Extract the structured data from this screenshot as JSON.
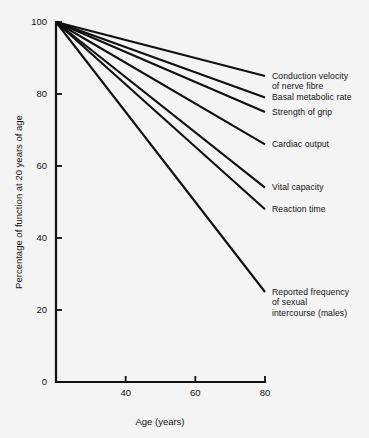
{
  "chart_data": {
    "type": "line",
    "title": "",
    "subtitle": "",
    "xlabel": "Age (years)",
    "ylabel": "Percentage of function at 20 years of age",
    "xlim": [
      20,
      80
    ],
    "ylim": [
      0,
      100
    ],
    "xticks": [
      40,
      60,
      80
    ],
    "xticklabels": [
      "40",
      "60",
      "80"
    ],
    "yticks": [
      0,
      20,
      40,
      60,
      80,
      100
    ],
    "yticklabels": [
      "0",
      "20",
      "40",
      "60",
      "80",
      "100"
    ],
    "grid": false,
    "legend_position": "right-inline-labels",
    "x": [
      20,
      80
    ],
    "series": [
      {
        "name": "Conduction velocity of nerve fibre",
        "label": "Conduction velocity\nof nerve fibre",
        "values": [
          100,
          85
        ]
      },
      {
        "name": "Basal metabolic rate",
        "label": "Basal metabolic rate",
        "values": [
          100,
          79
        ]
      },
      {
        "name": "Strength of grip",
        "label": "Strength of grip",
        "values": [
          100,
          75
        ]
      },
      {
        "name": "Cardiac output",
        "label": "Cardiac output",
        "values": [
          100,
          66
        ]
      },
      {
        "name": "Vital capacity",
        "label": "Vital capacity",
        "values": [
          100,
          54
        ]
      },
      {
        "name": "Reaction time",
        "label": "Reaction time",
        "values": [
          100,
          48
        ]
      },
      {
        "name": "Reported frequency of sexual intercourse (males)",
        "label": "Reported frequency\nof sexual\nintercourse (males)",
        "values": [
          100,
          25
        ]
      }
    ],
    "colors": {
      "line": "#101010",
      "axis": "#111111",
      "background": "#f4f4f4",
      "text": "#111111"
    }
  }
}
